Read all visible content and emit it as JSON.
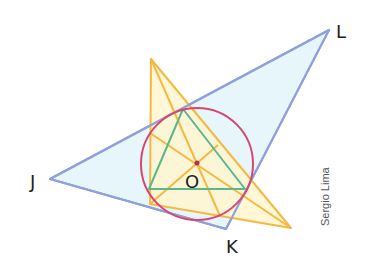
{
  "diagram": {
    "type": "geometry",
    "colors": {
      "blue_triangle_stroke": "#8fa0dc",
      "blue_triangle_fill": "#e6f6fb",
      "orange_stroke": "#f5b942",
      "orange_fill": "#fff6cf",
      "circle_stroke": "#d9466e",
      "green_stroke": "#5cb88a",
      "center_point": "#b0334f",
      "label_color": "#222222",
      "credit_color": "#555555"
    },
    "labels": {
      "J": "J",
      "K": "K",
      "L": "L",
      "O": "O"
    },
    "credit": "Sergio Lima"
  }
}
